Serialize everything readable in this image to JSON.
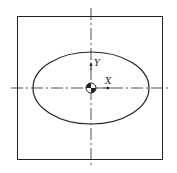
{
  "diagram": {
    "type": "section-view",
    "shapes": [
      "square-outline",
      "ellipse",
      "centerline-horizontal",
      "centerline-vertical",
      "centroid-symbol"
    ],
    "axes": {
      "x_label": "X",
      "y_label": "Y"
    },
    "colors": {
      "stroke": "#222222",
      "background": "#ffffff"
    }
  }
}
